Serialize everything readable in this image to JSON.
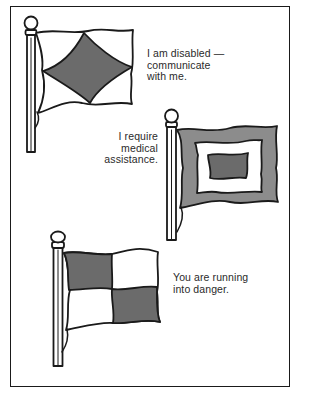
{
  "panel": {
    "signals": [
      {
        "flag_pattern": "white-with-gray-diamond",
        "caption_lines": [
          "I am disabled —",
          "communicate",
          "with me."
        ]
      },
      {
        "flag_pattern": "gray-border-white-frame-dark-center",
        "caption_lines": [
          "I require",
          "medical",
          "assistance."
        ]
      },
      {
        "flag_pattern": "gray-white-checkered-quarters",
        "caption_lines": [
          "You are running",
          "into danger."
        ]
      }
    ]
  },
  "colors": {
    "outline": "#1a1a1a",
    "fill_gray_dark": "#6b6b6b",
    "fill_gray_light": "#8c8c8c",
    "background": "#ffffff"
  }
}
